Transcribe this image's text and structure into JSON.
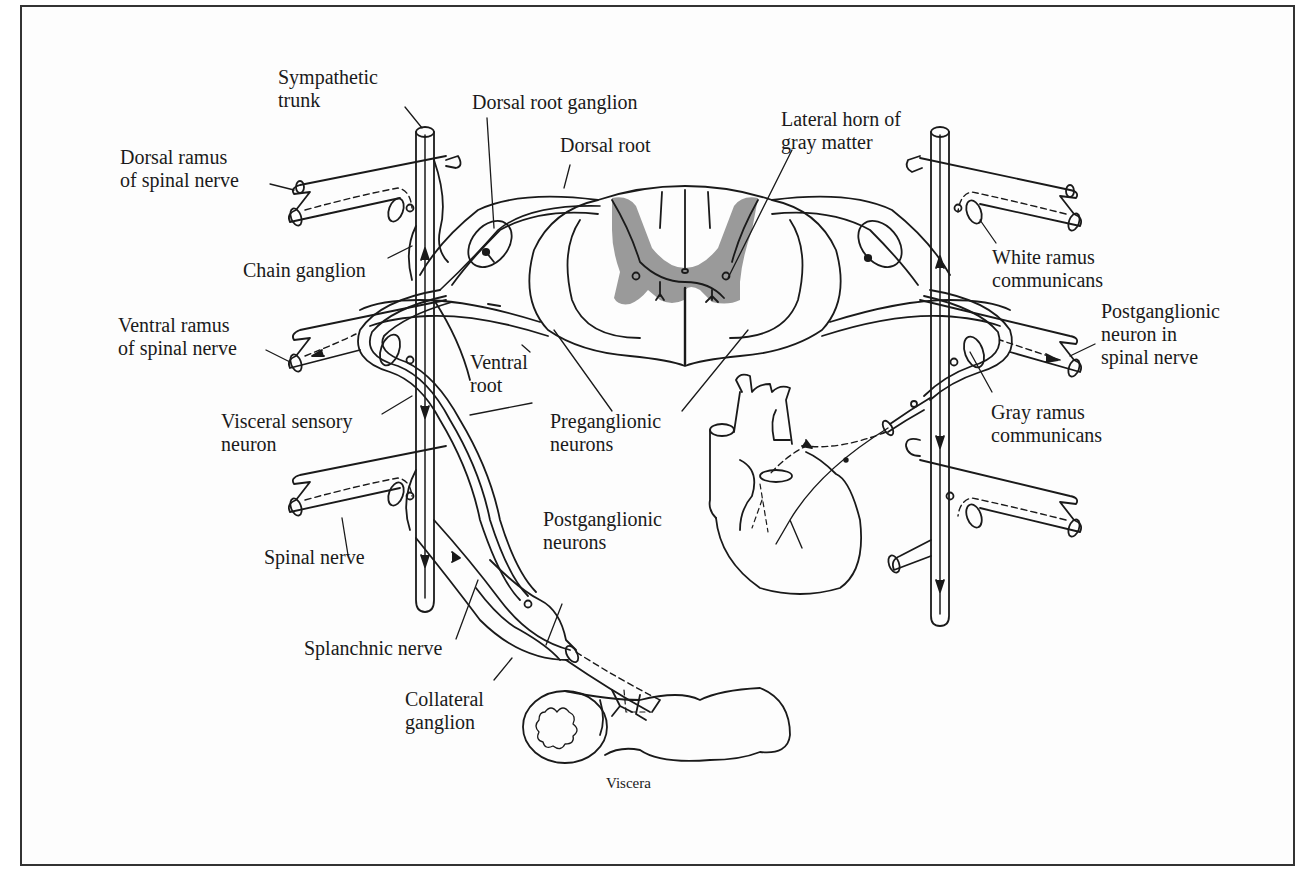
{
  "figure": {
    "labels": {
      "sympathetic_trunk": [
        "Sympathetic",
        "trunk"
      ],
      "dorsal_ramus": [
        "Dorsal ramus",
        "of spinal nerve"
      ],
      "chain_ganglion": [
        "Chain ganglion"
      ],
      "ventral_ramus": [
        "Ventral ramus",
        "of spinal nerve"
      ],
      "visceral_sensory": [
        "Visceral sensory",
        "neuron"
      ],
      "spinal_nerve": [
        "Spinal nerve"
      ],
      "splanchnic_nerve": [
        "Splanchnic nerve"
      ],
      "collateral_ganglion": [
        "Collateral",
        "ganglion"
      ],
      "dorsal_root_ganglion": [
        "Dorsal root ganglion"
      ],
      "dorsal_root": [
        "Dorsal root"
      ],
      "ventral_root": [
        "Ventral",
        "root"
      ],
      "preganglionic": [
        "Preganglionic",
        "neurons"
      ],
      "postganglionic": [
        "Postganglionic",
        "neurons"
      ],
      "lateral_horn": [
        "Lateral horn of",
        "gray matter"
      ],
      "white_ramus": [
        "White ramus",
        "communicans"
      ],
      "postganglionic_spinal": [
        "Postganglionic",
        "neuron in",
        "spinal nerve"
      ],
      "gray_ramus": [
        "Gray ramus",
        "communicans"
      ],
      "viscera": [
        "Viscera"
      ]
    },
    "colors": {
      "ink": "#1a1a1a",
      "gray_matter": "#9a9a9a",
      "border": "#333333",
      "background": "#fdfdfd"
    }
  }
}
